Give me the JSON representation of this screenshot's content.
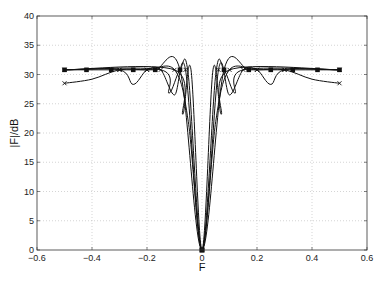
{
  "chart_data": {
    "type": "line",
    "title": "",
    "xlabel": "F",
    "ylabel": "|F|/dB",
    "xlim": [
      -0.6,
      0.6
    ],
    "ylim": [
      0,
      40
    ],
    "xticks": [
      -0.6,
      -0.4,
      -0.2,
      0,
      0.2,
      0.4,
      0.6
    ],
    "xtick_labels": [
      "-0.6",
      "-0.4",
      "-0.2",
      "0",
      "0.2",
      "0.4",
      "0.6"
    ],
    "yticks": [
      0,
      5,
      10,
      15,
      20,
      25,
      30,
      35,
      40
    ],
    "ytick_labels": [
      "0",
      "5",
      "10",
      "15",
      "20",
      "25",
      "30",
      "35",
      "40"
    ],
    "grid": true,
    "legend": null,
    "series": [
      {
        "name": "curve-1",
        "marker": "x",
        "x": [
          -0.5,
          -0.4,
          -0.3,
          -0.2,
          -0.1,
          -0.05,
          0,
          0.05,
          0.1,
          0.2,
          0.3,
          0.4,
          0.5
        ],
        "y": [
          28.5,
          29.2,
          30.8,
          30.8,
          30.8,
          22,
          0,
          22,
          30.8,
          30.8,
          30.8,
          29.2,
          28.5
        ]
      },
      {
        "name": "curve-2",
        "marker": "square",
        "x": [
          -0.5,
          -0.42,
          -0.33,
          -0.25,
          -0.17,
          -0.08,
          0,
          0.08,
          0.17,
          0.25,
          0.33,
          0.42,
          0.5
        ],
        "y": [
          30.8,
          30.8,
          30.8,
          30.8,
          30.8,
          30.8,
          0,
          30.8,
          30.8,
          30.8,
          30.8,
          30.8,
          30.8
        ]
      },
      {
        "name": "curve-3",
        "marker": "x",
        "x": [
          -0.5,
          -0.3,
          -0.25,
          -0.2,
          -0.15,
          -0.1,
          -0.06,
          0,
          0.06,
          0.1,
          0.15,
          0.2,
          0.25,
          0.3,
          0.5
        ],
        "y": [
          30.8,
          30.8,
          28.3,
          30.8,
          30.8,
          26.5,
          30.8,
          0,
          30.8,
          26.5,
          30.8,
          30.8,
          28.3,
          30.8,
          30.8
        ]
      },
      {
        "name": "curve-4",
        "marker": "none",
        "x": [
          -0.5,
          -0.15,
          -0.12,
          -0.08,
          -0.05,
          0,
          0.05,
          0.08,
          0.12,
          0.15,
          0.5
        ],
        "y": [
          30.8,
          30.8,
          26.8,
          30.8,
          30.0,
          0,
          30.0,
          30.8,
          26.8,
          30.8,
          30.8
        ]
      },
      {
        "name": "curve-5",
        "marker": "none",
        "x": [
          -0.5,
          -0.1,
          -0.07,
          -0.04,
          0,
          0.04,
          0.07,
          0.1,
          0.5
        ],
        "y": [
          30.8,
          30.8,
          23.2,
          30.8,
          0,
          30.8,
          23.2,
          30.8,
          30.8
        ]
      }
    ]
  },
  "ui": {
    "xlabel": "F",
    "ylabel": "|F|/dB"
  }
}
